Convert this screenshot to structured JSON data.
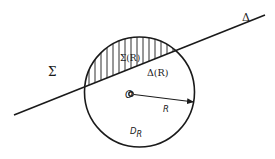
{
  "diagram": {
    "labels": {
      "sigma": "Σ",
      "delta": "Δ",
      "sigma_R": "Σ(R)",
      "delta_R": "Δ(R)",
      "origin": "O",
      "radius": "R",
      "disk": "D",
      "disk_subscript": "R"
    },
    "geometry": {
      "circle_center": [
        139.5,
        92
      ],
      "circle_radius": 55,
      "line_start": [
        14,
        115
      ],
      "line_end": [
        265,
        15
      ],
      "origin_point": [
        131,
        94
      ],
      "radius_arrow_end": [
        195,
        102
      ]
    },
    "colors": {
      "ink": "#1a1a1a",
      "background": "#ffffff"
    }
  }
}
